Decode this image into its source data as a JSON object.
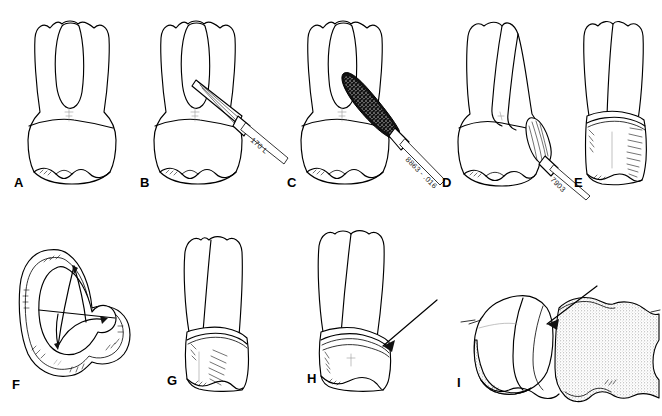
{
  "figure": {
    "background_color": "#ffffff",
    "line_color": "#000000",
    "stipple_color": "#9a9a9a",
    "panel_count": 9
  },
  "panels": [
    {
      "id": "A",
      "label": "A",
      "caption": "Unprepared maxillary first premolar, facial view with bifurcated roots",
      "has_bur": false,
      "has_arrow": false,
      "bur_label": ""
    },
    {
      "id": "B",
      "label": "B",
      "caption": "Occlusal reduction with tapered fissure bur",
      "has_bur": true,
      "has_arrow": false,
      "bur_label": "170 L"
    },
    {
      "id": "C",
      "label": "C",
      "caption": "Axial reduction with coarse diamond bur",
      "has_bur": true,
      "has_arrow": false,
      "bur_label": "8863 - .016"
    },
    {
      "id": "D",
      "label": "D",
      "caption": "Margin finishing with finishing bur, proximal view",
      "has_bur": true,
      "has_arrow": false,
      "bur_label": "7903"
    },
    {
      "id": "E",
      "label": "E",
      "caption": "Completed preparation, facial view",
      "has_bur": false,
      "has_arrow": false,
      "bur_label": ""
    },
    {
      "id": "F",
      "label": "F",
      "caption": "Occlusal view of completed preparation showing kidney-shaped outline",
      "has_bur": false,
      "has_arrow": false,
      "bur_label": ""
    },
    {
      "id": "G",
      "label": "G",
      "caption": "Completed preparation, proximal view",
      "has_bur": false,
      "has_arrow": false,
      "bur_label": ""
    },
    {
      "id": "H",
      "label": "H",
      "caption": "Completed preparation with arrow indicating margin",
      "has_bur": false,
      "has_arrow": true,
      "bur_label": ""
    },
    {
      "id": "I",
      "label": "I",
      "caption": "Prepared tooth adjacent to stippled neighbouring tooth, arrow at proximal contact",
      "has_bur": false,
      "has_arrow": true,
      "bur_label": ""
    }
  ]
}
